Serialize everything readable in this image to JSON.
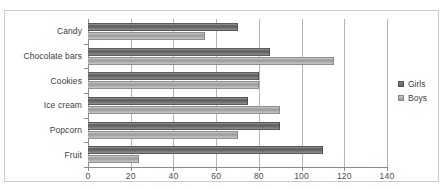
{
  "chart_data": {
    "type": "bar",
    "orientation": "horizontal",
    "title": "",
    "xlabel": "",
    "ylabel": "",
    "xlim": [
      0,
      140
    ],
    "xticks": [
      0,
      20,
      40,
      60,
      80,
      100,
      120,
      140
    ],
    "grid": true,
    "legend_position": "right",
    "categories": [
      "Candy",
      "Chocolate bars",
      "Cookies",
      "Ice cream",
      "Popcorn",
      "Fruit"
    ],
    "series": [
      {
        "name": "Girls",
        "color": "#5d5d5d",
        "values": [
          70,
          85,
          80,
          75,
          90,
          110
        ]
      },
      {
        "name": "Boys",
        "color": "#9c9c9c",
        "values": [
          55,
          115,
          80,
          90,
          70,
          24
        ]
      }
    ]
  },
  "legend": {
    "items": [
      {
        "label": "Girls"
      },
      {
        "label": "Boys"
      }
    ]
  }
}
